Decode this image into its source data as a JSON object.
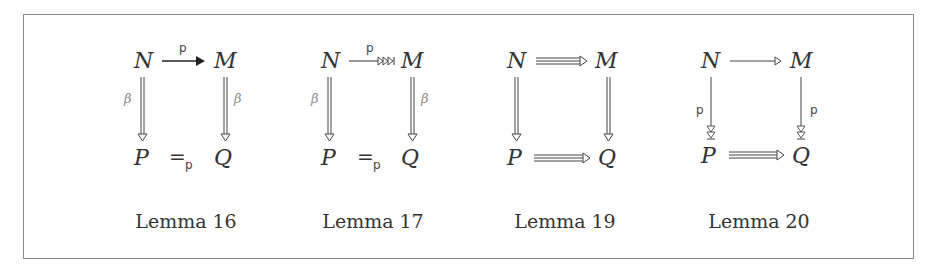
{
  "figure": {
    "diagrams": [
      {
        "caption": "Lemma 16",
        "nodes": {
          "tl": "N",
          "tr": "M",
          "bl": "P",
          "br": "Q"
        },
        "top_arrow": {
          "style": "single-solid-head",
          "label": "p"
        },
        "left_arrow": {
          "style": "double-open-head",
          "label": "β"
        },
        "right_arrow": {
          "style": "double-open-head",
          "label": "β"
        },
        "bottom_relation": {
          "symbol": "=",
          "subscript": "p"
        }
      },
      {
        "caption": "Lemma 17",
        "nodes": {
          "tl": "N",
          "tr": "M",
          "bl": "P",
          "br": "Q"
        },
        "top_arrow": {
          "style": "single-triple-open-head-bar",
          "label": "p"
        },
        "left_arrow": {
          "style": "double-open-head",
          "label": "β"
        },
        "right_arrow": {
          "style": "double-open-head",
          "label": "β"
        },
        "bottom_relation": {
          "symbol": "=",
          "subscript": "p"
        }
      },
      {
        "caption": "Lemma 19",
        "nodes": {
          "tl": "N",
          "tr": "M",
          "bl": "P",
          "br": "Q"
        },
        "top_arrow": {
          "style": "triple-open-head",
          "label": ""
        },
        "left_arrow": {
          "style": "double-open-head",
          "label": ""
        },
        "right_arrow": {
          "style": "double-open-head",
          "label": ""
        },
        "bottom_arrow": {
          "style": "triple-open-head",
          "label": ""
        }
      },
      {
        "caption": "Lemma 20",
        "nodes": {
          "tl": "N",
          "tr": "M",
          "bl": "P",
          "br": "Q"
        },
        "top_arrow": {
          "style": "single-open-head",
          "label": ""
        },
        "left_arrow": {
          "style": "single-double-open-head-bar",
          "label": "p"
        },
        "right_arrow": {
          "style": "single-double-open-head-bar",
          "label": "p"
        },
        "bottom_arrow": {
          "style": "triple-open-head",
          "label": ""
        }
      }
    ]
  }
}
